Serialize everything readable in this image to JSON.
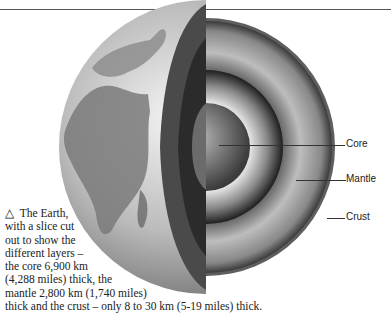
{
  "diagram": {
    "labels": [
      {
        "id": "core",
        "text": "Core"
      },
      {
        "id": "mantle",
        "text": "Mantle"
      },
      {
        "id": "crust",
        "text": "Crust"
      }
    ],
    "caption": {
      "marker": "△",
      "lines": [
        "The Earth,",
        "with a slice cut",
        "out to show the",
        "different layers –",
        "the core 6,900 km",
        "(4,288 miles) thick, the",
        "mantle 2,800 km (1,740 miles)",
        "thick and the crust – only 8 to 30 km (5-19 miles) thick."
      ]
    }
  }
}
